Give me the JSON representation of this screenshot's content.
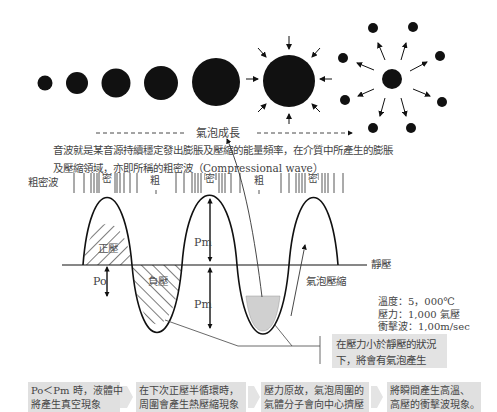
{
  "bubble_growth": {
    "label": "氣泡成長",
    "description_line1": "音波就是某音源持續穩定發出膨脹及壓縮的能量頻率，在介質中所產生的膨脹",
    "description_line2": "及壓縮領域，亦即所稱的粗密波（Compressional wave）"
  },
  "compression_wave": {
    "row_label": "粗密波",
    "zone_labels": [
      "密",
      "粗",
      "密",
      "粗",
      "密"
    ]
  },
  "wave": {
    "positive_pressure_label": "正壓",
    "negative_pressure_label": "負壓",
    "static_pressure_label": "靜壓",
    "po_label": "Po",
    "pm_upper_label": "Pm",
    "pm_lower_label": "Pm",
    "bubble_compression_label": "氣泡壓縮"
  },
  "stats": {
    "temperature": "溫度：5，000℃",
    "pressure": "壓力：1,000 氣壓",
    "shockwave": "衝擊波：1,00m/sec"
  },
  "note": {
    "text_line1": "在壓力小於靜壓的狀況",
    "text_line2": "下，將會有氣泡產生"
  },
  "steps": [
    {
      "line1": "Po＜Pm 時，液體中",
      "line2": "將產生真空現象"
    },
    {
      "line1": "在下次正壓半循環時，",
      "line2": "周圍會產生熱壓縮現象"
    },
    {
      "line1": "壓力原故，氣泡周圍的",
      "line2": "氣體分子會向中心擠壓"
    },
    {
      "line1": "將瞬間產生高溫、",
      "line2": "高壓的衝擊波現象。"
    }
  ],
  "colors": {
    "ink": "#111111",
    "shade": "#d6d6d6",
    "box": "#e0e0e0"
  }
}
